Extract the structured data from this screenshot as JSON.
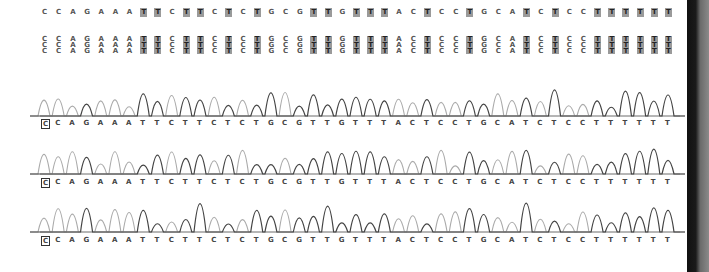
{
  "consensus": {
    "sequence": "CCAGAAATTCTTCTCTGCGTTGTTTACTCCTGCATCTCCTTTTTT",
    "bases": [
      "C",
      "C",
      "A",
      "G",
      "A",
      "A",
      "A",
      "T",
      "T",
      "C",
      "T",
      "T",
      "C",
      "T",
      "C",
      "T",
      "G",
      "C",
      "G",
      "T",
      "T",
      "G",
      "T",
      "T",
      "T",
      "A",
      "C",
      "T",
      "C",
      "C",
      "T",
      "G",
      "C",
      "A",
      "T",
      "C",
      "T",
      "C",
      "C",
      "T",
      "T",
      "T",
      "T",
      "T",
      "T"
    ],
    "highlight_base": "T"
  },
  "alignment": {
    "reads": 3,
    "rows": [
      "CCAGAAATTCTTCTCTGCGTTGTTTACTCCTGCATCTCCTTTTTT",
      "CCAGAAATTCTTCTCTGCGTTGTTTACTCCTGCATCTCCTTTTTT",
      "CCAGAAATTCTTCTCTGCGTTGTTTACTCCTGCATCTCCTTTTTT"
    ]
  },
  "traces": [
    {
      "name": "trace-1",
      "labels": "CCAGAAATTCTTCTCTGCGTTGTTTACTCCTGCATCTCCTTTTTT",
      "selected_index": 0
    },
    {
      "name": "trace-2",
      "labels": "CCAGAAATTCTTCTCTGCGTTGTTTACTCCTGCATCTCCTTTTTT",
      "selected_index": 0
    },
    {
      "name": "trace-3",
      "labels": "CCAGAAATTCTTCTCTGCGTTGTTTACTCCTGCATCTCCTTTTTT",
      "selected_index": 0
    }
  ],
  "colors": {
    "trace_dark": "#444444",
    "trace_light": "#aaaaaa",
    "highlight": "#9a9a9a",
    "sidebar": "#111111"
  }
}
